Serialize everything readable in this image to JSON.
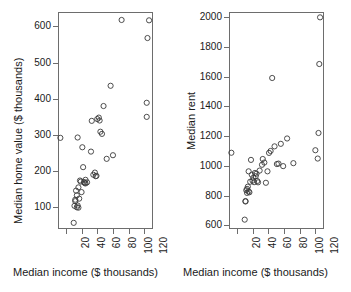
{
  "figure": {
    "background_color": "#ffffff",
    "frame_color": "#6d6d6d",
    "point_color": "#3a3a3a",
    "width": 351,
    "height": 292
  },
  "panels": [
    {
      "name": "median-home-value-vs-income",
      "xlabel": "Median income ($ thousands)",
      "ylabel": "Median home value ($ thousands)",
      "xticks": [
        "20",
        "40",
        "60",
        "80",
        "100",
        "120"
      ],
      "yticks": [
        "100",
        "200",
        "300",
        "400",
        "500",
        "600"
      ]
    },
    {
      "name": "median-rent-vs-income",
      "xlabel": "Median income ($ thousands)",
      "ylabel": "Median rent",
      "xticks": [
        "20",
        "40",
        "60",
        "80",
        "100",
        "120"
      ],
      "yticks": [
        "600",
        "800",
        "1000",
        "1200",
        "1400",
        "1600",
        "1800",
        "2000"
      ]
    }
  ],
  "chart_data": [
    {
      "type": "scatter",
      "title": "",
      "xlabel": "Median income ($ thousands)",
      "ylabel": "Median home value ($ thousands)",
      "xlim": [
        10,
        131
      ],
      "ylim": [
        40,
        640
      ],
      "xticks": [
        20,
        40,
        60,
        80,
        100,
        120
      ],
      "yticks": [
        100,
        200,
        300,
        400,
        500,
        600
      ],
      "grid": false,
      "legend": "none",
      "marker": "open-circle",
      "points": [
        {
          "x": 13,
          "y": 292
        },
        {
          "x": 30,
          "y": 57
        },
        {
          "x": 31,
          "y": 104
        },
        {
          "x": 32,
          "y": 121
        },
        {
          "x": 32,
          "y": 117
        },
        {
          "x": 33,
          "y": 146
        },
        {
          "x": 34,
          "y": 133
        },
        {
          "x": 34,
          "y": 100
        },
        {
          "x": 35,
          "y": 105
        },
        {
          "x": 35,
          "y": 293
        },
        {
          "x": 36,
          "y": 155
        },
        {
          "x": 36,
          "y": 99
        },
        {
          "x": 37,
          "y": 124
        },
        {
          "x": 38,
          "y": 174
        },
        {
          "x": 39,
          "y": 171
        },
        {
          "x": 40,
          "y": 142
        },
        {
          "x": 41,
          "y": 266
        },
        {
          "x": 42,
          "y": 211
        },
        {
          "x": 43,
          "y": 170
        },
        {
          "x": 44,
          "y": 167
        },
        {
          "x": 45,
          "y": 176
        },
        {
          "x": 45,
          "y": 166
        },
        {
          "x": 47,
          "y": 169
        },
        {
          "x": 52,
          "y": 254
        },
        {
          "x": 53,
          "y": 339
        },
        {
          "x": 55,
          "y": 190
        },
        {
          "x": 57,
          "y": 196
        },
        {
          "x": 58,
          "y": 186
        },
        {
          "x": 59,
          "y": 187
        },
        {
          "x": 60,
          "y": 344
        },
        {
          "x": 62,
          "y": 348
        },
        {
          "x": 63,
          "y": 340
        },
        {
          "x": 64,
          "y": 309
        },
        {
          "x": 66,
          "y": 303
        },
        {
          "x": 68,
          "y": 380
        },
        {
          "x": 72,
          "y": 234
        },
        {
          "x": 77,
          "y": 436
        },
        {
          "x": 80,
          "y": 244
        },
        {
          "x": 91,
          "y": 618
        },
        {
          "x": 123,
          "y": 350
        },
        {
          "x": 123,
          "y": 389
        },
        {
          "x": 124,
          "y": 568
        },
        {
          "x": 126,
          "y": 617
        }
      ]
    },
    {
      "type": "scatter",
      "title": "",
      "xlabel": "Median income ($ thousands)",
      "ylabel": "Median rent",
      "xlim": [
        10,
        131
      ],
      "ylim": [
        575,
        2035
      ],
      "xticks": [
        20,
        40,
        60,
        80,
        100,
        120
      ],
      "yticks": [
        600,
        800,
        1000,
        1200,
        1400,
        1600,
        1800,
        2000
      ],
      "grid": false,
      "legend": "none",
      "marker": "open-circle",
      "points": [
        {
          "x": 13,
          "y": 1088
        },
        {
          "x": 30,
          "y": 638
        },
        {
          "x": 31,
          "y": 763
        },
        {
          "x": 31,
          "y": 760
        },
        {
          "x": 32,
          "y": 836
        },
        {
          "x": 33,
          "y": 818
        },
        {
          "x": 33,
          "y": 845
        },
        {
          "x": 34,
          "y": 860
        },
        {
          "x": 35,
          "y": 963
        },
        {
          "x": 35,
          "y": 828
        },
        {
          "x": 36,
          "y": 822
        },
        {
          "x": 37,
          "y": 893
        },
        {
          "x": 38,
          "y": 1040
        },
        {
          "x": 39,
          "y": 940
        },
        {
          "x": 40,
          "y": 900
        },
        {
          "x": 41,
          "y": 920
        },
        {
          "x": 42,
          "y": 890
        },
        {
          "x": 43,
          "y": 952
        },
        {
          "x": 44,
          "y": 930
        },
        {
          "x": 45,
          "y": 947
        },
        {
          "x": 46,
          "y": 898
        },
        {
          "x": 47,
          "y": 889
        },
        {
          "x": 49,
          "y": 968
        },
        {
          "x": 52,
          "y": 1007
        },
        {
          "x": 53,
          "y": 1046
        },
        {
          "x": 55,
          "y": 1022
        },
        {
          "x": 57,
          "y": 886
        },
        {
          "x": 59,
          "y": 963
        },
        {
          "x": 61,
          "y": 1087
        },
        {
          "x": 63,
          "y": 1100
        },
        {
          "x": 65,
          "y": 1591
        },
        {
          "x": 68,
          "y": 1131
        },
        {
          "x": 71,
          "y": 1012
        },
        {
          "x": 73,
          "y": 1015
        },
        {
          "x": 76,
          "y": 1148
        },
        {
          "x": 79,
          "y": 998
        },
        {
          "x": 84,
          "y": 1184
        },
        {
          "x": 92,
          "y": 1018
        },
        {
          "x": 120,
          "y": 1105
        },
        {
          "x": 123,
          "y": 1049
        },
        {
          "x": 124,
          "y": 1221
        },
        {
          "x": 125,
          "y": 1685
        },
        {
          "x": 126,
          "y": 1999
        }
      ]
    }
  ]
}
